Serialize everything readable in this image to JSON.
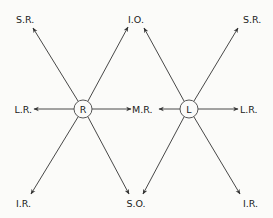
{
  "diagram": {
    "type": "eye-muscle-actions",
    "colors": {
      "line": "#333333",
      "text": "#222222",
      "background": "#fbfbf9"
    },
    "nodes": {
      "right": {
        "label": "R",
        "cx": 83,
        "cy": 109,
        "r": 9
      },
      "left": {
        "label": "L",
        "cx": 189,
        "cy": 109,
        "r": 9
      }
    },
    "labels": {
      "top_left": "S.R.",
      "top_center": "I.O.",
      "top_right": "S.R.",
      "mid_left": "L.R.",
      "mid_center": "M.R.",
      "mid_right": "L.R.",
      "bottom_left": "I.R.",
      "bottom_center": "S.O.",
      "bottom_right": "I.R."
    },
    "edges": [
      {
        "from": "R",
        "to": "S.R. (top-left)"
      },
      {
        "from": "R",
        "to": "I.O. (top-center)"
      },
      {
        "from": "R",
        "to": "L.R. (mid-left)"
      },
      {
        "from": "R",
        "to": "M.R. (mid-center)"
      },
      {
        "from": "R",
        "to": "I.R. (bottom-left)"
      },
      {
        "from": "R",
        "to": "S.O. (bottom-center)"
      },
      {
        "from": "L",
        "to": "I.O. (top-center)"
      },
      {
        "from": "L",
        "to": "S.R. (top-right)"
      },
      {
        "from": "L",
        "to": "M.R. (mid-center)"
      },
      {
        "from": "L",
        "to": "L.R. (mid-right)"
      },
      {
        "from": "L",
        "to": "S.O. (bottom-center)"
      },
      {
        "from": "L",
        "to": "I.R. (bottom-right)"
      }
    ]
  }
}
